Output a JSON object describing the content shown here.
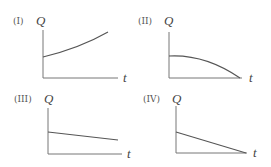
{
  "figure": {
    "panels": [
      {
        "label": "(I)",
        "y_axis_label": "Q",
        "x_axis_label": "t",
        "shape": "increasing, concave up",
        "label_pos": [
          13,
          24
        ],
        "ylabel_pos": [
          36,
          25
        ],
        "xlabel_pos": [
          123,
          82
        ],
        "origin": [
          43,
          78
        ],
        "y_top": 30,
        "x_end": 118,
        "curve_path": "M43,57 Q80,48 108,32"
      },
      {
        "label": "(II)",
        "y_axis_label": "Q",
        "x_axis_label": "t",
        "shape": "decreasing, concave down, reaching zero",
        "label_pos": [
          138,
          24
        ],
        "ylabel_pos": [
          164,
          25
        ],
        "xlabel_pos": [
          249,
          82
        ],
        "origin": [
          169,
          78
        ],
        "y_top": 32,
        "x_end": 242,
        "curve_path": "M169,56 Q205,54 240,78"
      },
      {
        "label": "(III)",
        "y_axis_label": "Q",
        "x_axis_label": "t",
        "shape": "slowly decreasing, linear",
        "label_pos": [
          14,
          102
        ],
        "ylabel_pos": [
          44,
          103
        ],
        "xlabel_pos": [
          127,
          158
        ],
        "origin": [
          48,
          154
        ],
        "y_top": 108,
        "x_end": 122,
        "curve_path": "M48,132 L118,140"
      },
      {
        "label": "(IV)",
        "y_axis_label": "Q",
        "x_axis_label": "t",
        "shape": "decreasing linearly to zero",
        "label_pos": [
          143,
          102
        ],
        "ylabel_pos": [
          172,
          103
        ],
        "xlabel_pos": [
          253,
          157
        ],
        "origin": [
          176,
          153
        ],
        "y_top": 106,
        "x_end": 247,
        "curve_path": "M176,132 L246,153"
      }
    ]
  }
}
